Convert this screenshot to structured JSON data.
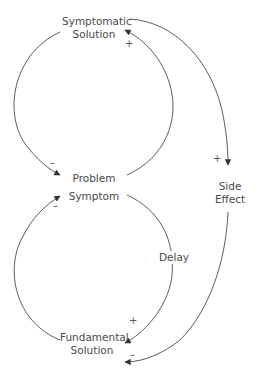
{
  "diagram": {
    "title": "",
    "nodes": {
      "symptomatic_solution": {
        "line1": "Symptomatic",
        "line2": "Solution"
      },
      "problem_symptom": {
        "line1": "Problem",
        "line2": "Symptom"
      },
      "side_effect": {
        "line1": "Side",
        "line2": "Effect"
      },
      "fundamental_solution": {
        "line1": "Fundamental",
        "line2": "Solution"
      },
      "delay": {
        "label": "Delay"
      }
    },
    "polarities": {
      "sym_to_problem": "–",
      "problem_to_sym": "+",
      "sym_to_side": "+",
      "fund_to_problem": "–",
      "problem_to_fund": "+",
      "side_to_fund": "–"
    },
    "edges": [
      {
        "from": "Problem Symptom",
        "to": "Symptomatic Solution",
        "polarity": "+"
      },
      {
        "from": "Symptomatic Solution",
        "to": "Problem Symptom",
        "polarity": "–"
      },
      {
        "from": "Symptomatic Solution",
        "to": "Side Effect",
        "polarity": "+"
      },
      {
        "from": "Problem Symptom",
        "to": "Fundamental Solution",
        "polarity": "+",
        "delay": true
      },
      {
        "from": "Fundamental Solution",
        "to": "Problem Symptom",
        "polarity": "–"
      },
      {
        "from": "Side Effect",
        "to": "Fundamental Solution",
        "polarity": "–"
      }
    ],
    "colors": {
      "line": "#4a4a4a",
      "text": "#4a4a4a"
    }
  }
}
